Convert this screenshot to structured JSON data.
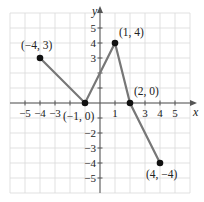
{
  "chart_data": {
    "type": "line",
    "title": "",
    "xlabel": "x",
    "ylabel": "y",
    "xlim": [
      -6,
      6
    ],
    "ylim": [
      -6,
      6
    ],
    "grid": true,
    "x_ticks": [
      -5,
      -4,
      -3,
      1,
      3,
      4,
      5
    ],
    "x_tick_labels": [
      "−5",
      "−4",
      "−3",
      "1",
      "3",
      "4",
      "5"
    ],
    "y_ticks": [
      5,
      4,
      3,
      -2,
      -3,
      -4,
      -5
    ],
    "y_tick_labels": [
      "5",
      "4",
      "3",
      "−2",
      "−3",
      "−4",
      "−5"
    ],
    "series": [
      {
        "name": "piecewise",
        "x": [
          -4,
          -1,
          1,
          2,
          4
        ],
        "y": [
          3,
          0,
          4,
          0,
          -4
        ]
      }
    ],
    "annotations": [
      {
        "x": -4,
        "y": 3,
        "text": "(−4, 3)"
      },
      {
        "x": -1,
        "y": 0,
        "text": "(−1, 0)"
      },
      {
        "x": 1,
        "y": 4,
        "text": "(1, 4)"
      },
      {
        "x": 2,
        "y": 0,
        "text": "(2, 0)"
      },
      {
        "x": 4,
        "y": -4,
        "text": "(4, −4)"
      }
    ],
    "colors": {
      "line": "#777777",
      "points": "#111111",
      "grid": "#d9d9d9",
      "axis": "#555555"
    }
  }
}
